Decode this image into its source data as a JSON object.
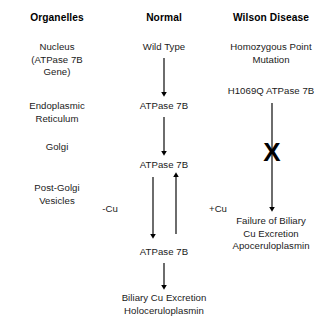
{
  "diagram": {
    "background_color": "#ffffff",
    "text_color": "#1a1a1a",
    "arrow_color": "#000000"
  },
  "columns": {
    "organelles": {
      "header": "Organelles",
      "items": [
        "Nucleus\n(ATPase 7B\nGene)",
        "Endoplasmic\nReticulum",
        "Golgi",
        "Post-Golgi\nVesicles"
      ]
    },
    "normal": {
      "header": "Normal",
      "nodes": [
        "Wild Type",
        "ATPase 7B",
        "ATPase 7B",
        "ATPase 7B",
        "Biliary Cu Excretion\nHoloceruloplasmin"
      ],
      "flux_labels": {
        "efflux": "-Cu",
        "influx": "+Cu"
      }
    },
    "wilson": {
      "header": "Wilson Disease",
      "nodes": [
        "Homozygous Point\nMutation",
        "H1069Q ATPase 7B",
        "Failure of Biliary\nCu Excretion\nApoceruloplasmin"
      ],
      "block_marker": "X"
    }
  }
}
